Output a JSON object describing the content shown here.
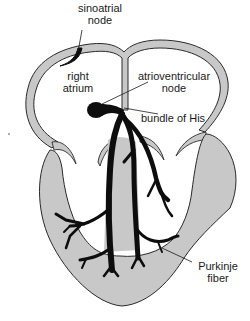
{
  "diagram": {
    "colors": {
      "wall_fill": "#c8c8c8",
      "outline": "#2a2a2a",
      "conduction": "#0d0d0d",
      "background": "#ffffff"
    },
    "labels": {
      "sinoatrial_node": {
        "line1": "sinoatrial",
        "line2": "node"
      },
      "right_atrium": {
        "line1": "right",
        "line2": "atrium"
      },
      "atrioventricular_node": {
        "line1": "atrioventricular",
        "line2": "node"
      },
      "bundle_of_his": {
        "line1": "bundle of His"
      },
      "purkinje_fiber": {
        "line1": "Purkinje",
        "line2": "fiber"
      }
    }
  }
}
